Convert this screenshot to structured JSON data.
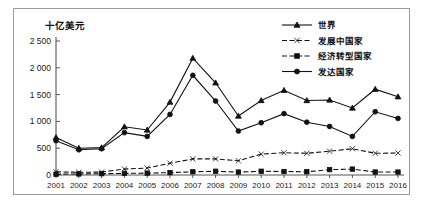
{
  "figure": {
    "unit_label": "十亿美元",
    "border_color": "#9a9a9a",
    "line_color": "#111111"
  },
  "chart_data": {
    "type": "line",
    "title": "",
    "subtitle": "",
    "xlabel": "",
    "ylabel": "十亿美元",
    "ylim": [
      0,
      2500
    ],
    "yticks": [
      0,
      500,
      1000,
      1500,
      2000,
      2500
    ],
    "ytick_labels": [
      "0",
      "500",
      "1 000",
      "1 500",
      "2 000",
      "2 500"
    ],
    "grid": false,
    "legend_position": "top-right",
    "categories": [
      "2001",
      "2002",
      "2003",
      "2004",
      "2005",
      "2006",
      "2007",
      "2008",
      "2009",
      "2010",
      "2011",
      "2012",
      "2013",
      "2014",
      "2015",
      "2016"
    ],
    "series": [
      {
        "name": "世界",
        "marker": "triangle",
        "linestyle": "solid",
        "values": [
          700,
          500,
          510,
          900,
          840,
          1360,
          2180,
          1720,
          1100,
          1390,
          1580,
          1390,
          1400,
          1250,
          1600,
          1460
        ]
      },
      {
        "name": "发展中国家",
        "marker": "x",
        "linestyle": "dashed",
        "values": [
          60,
          50,
          55,
          110,
          130,
          220,
          300,
          300,
          265,
          390,
          415,
          405,
          445,
          490,
          405,
          410
        ]
      },
      {
        "name": "经济转型国家",
        "marker": "square",
        "linestyle": "dashed",
        "values": [
          15,
          20,
          25,
          30,
          35,
          45,
          60,
          70,
          55,
          70,
          65,
          60,
          100,
          110,
          55,
          55
        ]
      },
      {
        "name": "发达国家",
        "marker": "circle",
        "linestyle": "solid",
        "values": [
          640,
          470,
          490,
          790,
          720,
          1130,
          1860,
          1380,
          820,
          975,
          1145,
          985,
          905,
          720,
          1180,
          1055
        ]
      }
    ]
  }
}
